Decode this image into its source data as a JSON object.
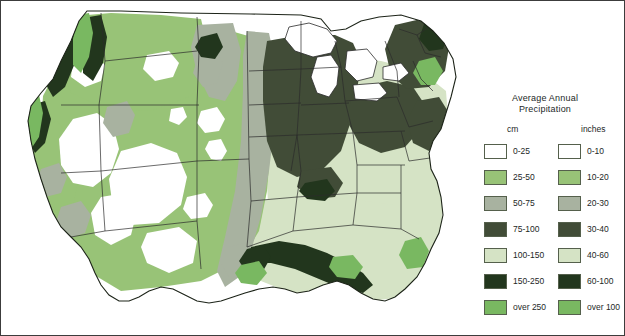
{
  "figure": {
    "kind": "thematic-choropleth-map",
    "region": "Contiguous United States",
    "background_color": "#ffffff",
    "border_color": "#3c3c3c",
    "state_boundary_color": "#2b2b2b",
    "coast_outline_color": "#1d2419"
  },
  "legend": {
    "title_line1": "Average Annual",
    "title_line2": "Precipitation",
    "column_headers": {
      "metric": "cm",
      "imperial": "inches"
    },
    "classes": [
      {
        "cm": "0-25",
        "inches": "0-10",
        "color": "#ffffff"
      },
      {
        "cm": "25-50",
        "inches": "10-20",
        "color": "#98c377"
      },
      {
        "cm": "50-75",
        "inches": "20-30",
        "color": "#a8b2a0"
      },
      {
        "cm": "75-100",
        "inches": "30-40",
        "color": "#414c37"
      },
      {
        "cm": "100-150",
        "inches": "40-60",
        "color": "#d5e3c5"
      },
      {
        "cm": "150-250",
        "inches": "60-100",
        "color": "#22361d"
      },
      {
        "cm": "over 250",
        "inches": "over 100",
        "color": "#79b861"
      }
    ]
  },
  "chart_data": {
    "type": "map",
    "title": "Average Annual Precipitation",
    "units_primary": "cm",
    "units_secondary": "inches",
    "classification": "7-class choropleth (graduated precipitation bands)",
    "legend_position": "right",
    "class_breaks_cm": [
      0,
      25,
      50,
      75,
      100,
      150,
      250
    ],
    "class_breaks_in": [
      0,
      10,
      20,
      30,
      40,
      60,
      100
    ],
    "regions": [
      {
        "name": "Pacific Northwest coast",
        "class_cm": "over 250",
        "class_in": "over 100"
      },
      {
        "name": "Cascade / Coast ranges",
        "class_cm": "150-250",
        "class_in": "60-100"
      },
      {
        "name": "Interior Northwest",
        "class_cm": "25-50",
        "class_in": "10-20"
      },
      {
        "name": "Great Basin / Southwest desert",
        "class_cm": "0-25",
        "class_in": "0-10"
      },
      {
        "name": "Northern Rockies",
        "class_cm": "50-75",
        "class_in": "20-30"
      },
      {
        "name": "Great Plains",
        "class_cm": "25-50",
        "class_in": "10-20"
      },
      {
        "name": "Central Plains transition",
        "class_cm": "50-75",
        "class_in": "20-30"
      },
      {
        "name": "Upper Midwest / Great Lakes",
        "class_cm": "75-100",
        "class_in": "30-40"
      },
      {
        "name": "Ohio Valley / Appalachians",
        "class_cm": "75-100",
        "class_in": "30-40"
      },
      {
        "name": "Southeast / Gulf states",
        "class_cm": "100-150",
        "class_in": "40-60"
      },
      {
        "name": "Gulf Coast belt",
        "class_cm": "150-250",
        "class_in": "60-100"
      },
      {
        "name": "Northeast / New England",
        "class_cm": "75-100",
        "class_in": "30-40"
      }
    ]
  }
}
